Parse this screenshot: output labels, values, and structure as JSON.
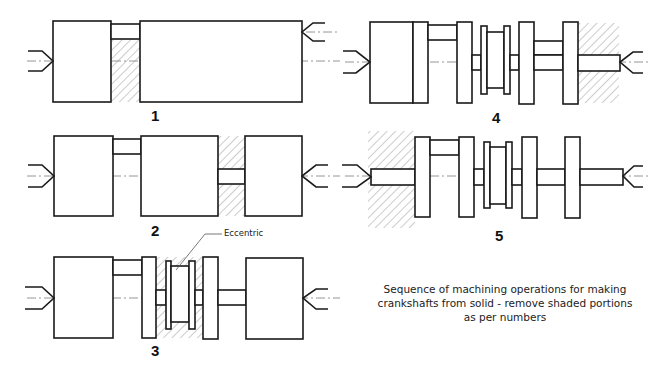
{
  "title": "Sequence of machining operations for making crankshafts from solid",
  "caption": {
    "line1": "Sequence of machining operations for making",
    "line2": "crankshafts from solid - remove shaded portions",
    "line3": "as per numbers"
  },
  "steps": [
    {
      "number": "1"
    },
    {
      "number": "2"
    },
    {
      "number": "3"
    },
    {
      "number": "4"
    },
    {
      "number": "5"
    }
  ],
  "annotations": {
    "eccentric": "Eccentric"
  },
  "colors": {
    "line": "#1a1a1a",
    "centerline": "#8a8a8a",
    "hatch": "#9a9a9a",
    "background": "#ffffff"
  }
}
